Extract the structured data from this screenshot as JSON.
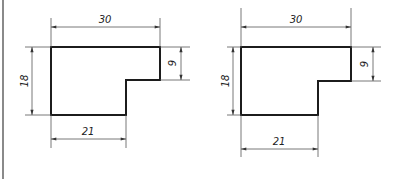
{
  "drawings": [
    {
      "id": "left",
      "dims": {
        "top_width": "30",
        "left_height": "18",
        "right_step_height": "9",
        "bottom_width": "21"
      }
    },
    {
      "id": "right",
      "dims": {
        "top_width": "30",
        "left_height": "18",
        "right_step_height": "9",
        "bottom_width": "21"
      }
    }
  ],
  "colors": {
    "outline": "#1c1c1c",
    "dimension_line": "#555555",
    "frame_edge": "#8a8a8a",
    "background": "#ffffff"
  }
}
